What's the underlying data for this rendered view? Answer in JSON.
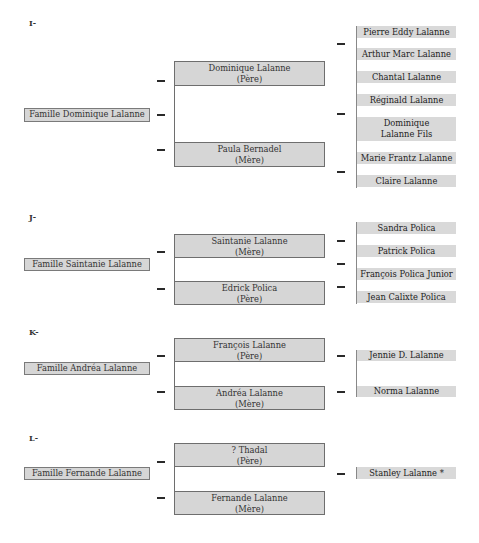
{
  "sections": [
    {
      "label": "I-",
      "family": "Famille Dominique Lalanne",
      "parents": [
        {
          "name": "Dominique Lalanne",
          "role": "(Père)"
        },
        {
          "name": "Paula Bernadel",
          "role": "(Mère)"
        }
      ],
      "children": [
        "Pierre Eddy Lalanne",
        "Arthur Marc Lalanne",
        "Chantal Lalanne",
        "Réginald Lalanne",
        "Dominique Lalanne Fils",
        "Marie Frantz Lalanne",
        "Claire Lalanne"
      ]
    },
    {
      "label": "J-",
      "family": "Famille Saintanie Lalanne",
      "parents": [
        {
          "name": "Saintanie Lalanne",
          "role": "(Mère)"
        },
        {
          "name": "Edrick Polica",
          "role": "(Père)"
        }
      ],
      "children": [
        "Sandra Polica",
        "Patrick Polica",
        "François Polica Junior",
        "Jean Calixte Polica"
      ]
    },
    {
      "label": "K-",
      "family": "Famille Andréa Lalanne",
      "parents": [
        {
          "name": "François Lalanne",
          "role": "(Père)"
        },
        {
          "name": "Andréa Lalanne",
          "role": "(Mère)"
        }
      ],
      "children": [
        "Jennie D. Lalanne",
        "Norma Lalanne"
      ]
    },
    {
      "label": "L-",
      "family": "Famille Fernande Lalanne",
      "parents": [
        {
          "name": "? Thadal",
          "role": "(Père)"
        },
        {
          "name": "Fernande Lalanne",
          "role": "(Mère)"
        }
      ],
      "children": [
        "Stanley Lalanne *"
      ]
    }
  ],
  "colors": {
    "box_fill": "#d6d6d6",
    "box_border": "#6e6e6e",
    "child_fill": "#d9d9d9",
    "dash": "#2a2a2a"
  }
}
